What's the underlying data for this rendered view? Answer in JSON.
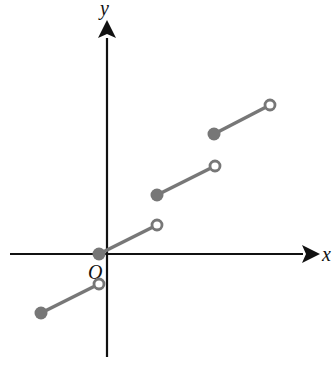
{
  "figure": {
    "type": "step-function-graph",
    "axes": {
      "x_label": "x",
      "y_label": "y",
      "origin_label": "O"
    },
    "colors": {
      "axis": "#111111",
      "segment": "#777777",
      "filled_dot": "#777777",
      "open_dot_fill": "#ffffff"
    },
    "segments": [
      {
        "start": {
          "x": -1,
          "y": -1,
          "closed": true
        },
        "end": {
          "x": 0,
          "y": -0.5,
          "closed": false
        }
      },
      {
        "start": {
          "x": 0,
          "y": 0,
          "closed": true
        },
        "end": {
          "x": 1,
          "y": 0.5,
          "closed": false
        }
      },
      {
        "start": {
          "x": 1,
          "y": 1,
          "closed": true
        },
        "end": {
          "x": 2,
          "y": 1.5,
          "closed": false
        }
      },
      {
        "start": {
          "x": 2,
          "y": 2,
          "closed": true
        },
        "end": {
          "x": 3,
          "y": 2.5,
          "closed": false
        }
      }
    ]
  }
}
